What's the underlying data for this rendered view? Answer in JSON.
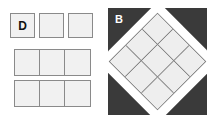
{
  "figure": {
    "background_color": "#ffffff",
    "panels": [
      {
        "id": "D",
        "label": "D",
        "label_position": "inside-first-cell",
        "background_color": "#ffffff",
        "cell_fill_color": "#f1f1f1",
        "cell_border_color": "#8a8a8a",
        "rows": [
          {
            "name": "top-row",
            "style": "separated",
            "cells": [
              {
                "label": "D"
              },
              {
                "label": ""
              },
              {
                "label": ""
              }
            ]
          },
          {
            "name": "middle-row",
            "style": "connected",
            "cells": [
              {
                "label": ""
              },
              {
                "label": ""
              },
              {
                "label": ""
              }
            ]
          },
          {
            "name": "bottom-row",
            "style": "connected",
            "cells": [
              {
                "label": ""
              },
              {
                "label": ""
              },
              {
                "label": ""
              }
            ]
          }
        ]
      },
      {
        "id": "B",
        "label": "B",
        "label_position": "top-left",
        "label_color": "#ffffff",
        "background_color": "#3a3a3a",
        "frame_color": "#ffffff",
        "grid": {
          "rows": 3,
          "columns": 3,
          "rotation_degrees": 45,
          "cell_fill_color": "#eeeeee",
          "cell_border_color": "#7d7d7d",
          "cells": [
            {
              "label": ""
            },
            {
              "label": ""
            },
            {
              "label": ""
            },
            {
              "label": ""
            },
            {
              "label": ""
            },
            {
              "label": ""
            },
            {
              "label": ""
            },
            {
              "label": ""
            },
            {
              "label": ""
            }
          ]
        }
      }
    ]
  }
}
